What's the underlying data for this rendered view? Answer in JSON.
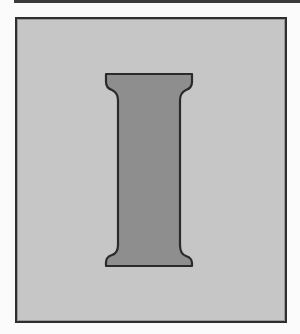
{
  "illustration": {
    "letter": "I",
    "description": "Large serif capital letter I inside a bordered gray panel",
    "colors": {
      "page_background": "#fbfbfb",
      "top_rule": "#3a3a3a",
      "panel_fill": "#c6c6c6",
      "panel_border": "#2e2e2e",
      "letter_fill": "#8e8e8e",
      "letter_outline": "#2a2a2a"
    }
  }
}
